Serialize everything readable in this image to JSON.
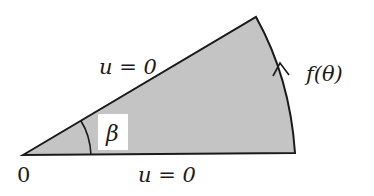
{
  "diagram": {
    "type": "wedge-domain",
    "colors": {
      "fill": "#c4c4c4",
      "stroke": "#1a1a1a",
      "label_box": "#ffffff"
    },
    "labels": {
      "origin": "0",
      "angle": "β",
      "upper_edge": "u = 0",
      "lower_edge": "u = 0",
      "arc_boundary": "f(θ)"
    }
  }
}
